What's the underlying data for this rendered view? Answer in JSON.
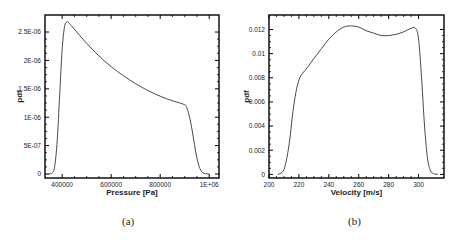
{
  "chart_data": [
    {
      "type": "line",
      "title": "",
      "xlabel": "Pressure [Pa]",
      "ylabel": "pdf",
      "caption": "(a)",
      "xlim": [
        330000,
        1040000
      ],
      "ylim": [
        -7e-08,
        2.8e-06
      ],
      "xticks": [
        400000,
        600000,
        800000,
        1000000
      ],
      "xtick_labels": [
        "400000",
        "600000",
        "800000",
        "1E+06"
      ],
      "yticks": [
        0,
        5e-07,
        1e-06,
        1.5e-06,
        2e-06,
        2.5e-06
      ],
      "ytick_labels": [
        "0",
        "5E-07",
        "1E-06",
        "1.5E-06",
        "2E-06",
        "2.5E-06"
      ],
      "grid": false,
      "legend": null,
      "series": [
        {
          "name": "pdf",
          "x": [
            340000,
            360000,
            370000,
            380000,
            390000,
            400000,
            410000,
            420000,
            430000,
            450000,
            500000,
            550000,
            600000,
            650000,
            700000,
            750000,
            800000,
            850000,
            900000,
            910000,
            920000,
            930000,
            940000,
            950000,
            960000,
            970000,
            980000,
            1000000
          ],
          "y": [
            0.0,
            2e-08,
            1.5e-07,
            6e-07,
            1.4e-06,
            2.2e-06,
            2.6e-06,
            2.68e-06,
            2.65e-06,
            2.55e-06,
            2.3e-06,
            2.08e-06,
            1.89e-06,
            1.73e-06,
            1.59e-06,
            1.47e-06,
            1.37e-06,
            1.29e-06,
            1.22e-06,
            1.15e-06,
            1e-06,
            7.8e-07,
            5.2e-07,
            2.8e-07,
            1.2e-07,
            4e-08,
            1e-08,
            0.0
          ]
        }
      ]
    },
    {
      "type": "line",
      "title": "",
      "xlabel": "Velocity [m/s]",
      "ylabel": "pdf",
      "caption": "(b)",
      "xlim": [
        200,
        317
      ],
      "ylim": [
        -0.0003,
        0.0132
      ],
      "xticks": [
        200,
        220,
        240,
        260,
        280,
        300
      ],
      "xtick_labels": [
        "200",
        "220",
        "240",
        "260",
        "280",
        "300"
      ],
      "yticks": [
        0,
        0.002,
        0.004,
        0.006,
        0.008,
        0.01,
        0.012
      ],
      "ytick_labels": [
        "0",
        "0.002",
        "0.004",
        "0.006",
        "0.008",
        "0.01",
        "0.012"
      ],
      "grid": false,
      "legend": null,
      "series": [
        {
          "name": "pdf",
          "x": [
            206,
            208,
            210,
            212,
            214,
            216,
            218,
            220,
            222,
            226,
            230,
            235,
            240,
            245,
            250,
            255,
            260,
            265,
            270,
            275,
            280,
            285,
            290,
            295,
            298,
            300,
            302,
            304,
            306,
            308,
            310,
            313
          ],
          "y": [
            0.0,
            0.0001,
            0.0004,
            0.0014,
            0.003,
            0.0052,
            0.0068,
            0.0078,
            0.0083,
            0.0089,
            0.0096,
            0.0104,
            0.0112,
            0.0118,
            0.0122,
            0.0123,
            0.0122,
            0.0119,
            0.0117,
            0.0115,
            0.0115,
            0.0116,
            0.0118,
            0.0121,
            0.0121,
            0.0112,
            0.008,
            0.004,
            0.0013,
            0.0003,
            5e-05,
            0.0
          ]
        }
      ]
    }
  ]
}
